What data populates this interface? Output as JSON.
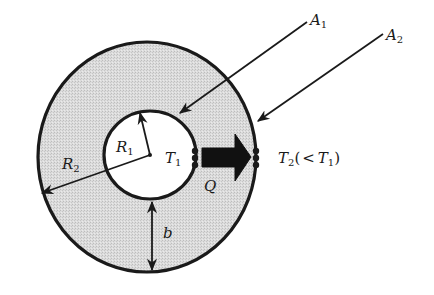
{
  "diagram": {
    "colors": {
      "stroke": "#1a1a1a",
      "annulus_fill": "#d9d9d9",
      "inner_fill": "#ffffff",
      "background": "#ffffff"
    },
    "labels": {
      "A1": {
        "main": "A",
        "sub": "1"
      },
      "A2": {
        "main": "A",
        "sub": "2"
      },
      "R1": {
        "main": "R",
        "sub": "1"
      },
      "R2": {
        "main": "R",
        "sub": "2"
      },
      "T1": {
        "main": "T",
        "sub": "1"
      },
      "T2": {
        "main": "T",
        "sub": "2",
        "paren_open": "(",
        "lt": "<",
        "ref_main": "T",
        "ref_sub": "1",
        "paren_close": ")"
      },
      "Q": "Q",
      "b": "b"
    },
    "shapes": {
      "outer_circle": {
        "cx": 147,
        "cy": 157,
        "rx": 109,
        "ry": 115
      },
      "inner_circle": {
        "cx": 150,
        "cy": 155,
        "rx": 46,
        "ry": 44
      }
    }
  }
}
